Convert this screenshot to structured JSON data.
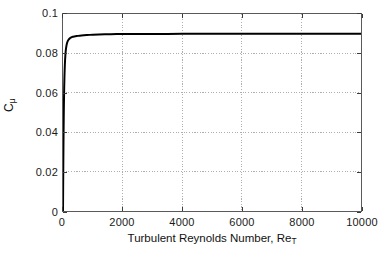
{
  "chart_data": {
    "type": "line",
    "title": "",
    "subtitle": "",
    "xlabel_prefix": "Turbulent Reynolds Number, Re",
    "xlabel_subscript": "T",
    "xlabel_full": "Turbulent Reynolds Number, Re_T",
    "ylabel_prefix": "C",
    "ylabel_subscript": "μ",
    "ylabel_full": "C_μ",
    "xlim": [
      0,
      10000
    ],
    "ylim": [
      0,
      0.1
    ],
    "xticks": [
      0,
      2000,
      4000,
      6000,
      8000,
      10000
    ],
    "xtick_labels": [
      "0",
      "2000",
      "4000",
      "6000",
      "8000",
      "10000"
    ],
    "yticks": [
      0,
      0.02,
      0.04,
      0.06,
      0.08,
      0.1
    ],
    "ytick_labels": [
      "0",
      "0.02",
      "0.04",
      "0.06",
      "0.08",
      "0.1"
    ],
    "grid": true,
    "grid_style": "dotted",
    "legend": null,
    "legend_position": "none",
    "line_color": "#000000",
    "line_width": 2.0,
    "asymptote_value": 0.09,
    "series": [
      {
        "name": "C_mu",
        "x": [
          0,
          5,
          10,
          15,
          20,
          25,
          30,
          40,
          50,
          60,
          70,
          80,
          90,
          100,
          120,
          140,
          160,
          180,
          200,
          230,
          260,
          300,
          340,
          380,
          420,
          460,
          500,
          560,
          620,
          700,
          800,
          900,
          1000,
          1200,
          1400,
          1600,
          1800,
          2000,
          2500,
          3000,
          3500,
          4000,
          5000,
          6000,
          7000,
          8000,
          9000,
          10000
        ],
        "y": [
          0.0,
          0.0118,
          0.0228,
          0.0325,
          0.0408,
          0.0478,
          0.0537,
          0.0627,
          0.069,
          0.0735,
          0.0768,
          0.0792,
          0.081,
          0.0824,
          0.0843,
          0.0855,
          0.0863,
          0.0868,
          0.0872,
          0.0877,
          0.088,
          0.0883,
          0.0885,
          0.0886,
          0.0887,
          0.0888,
          0.0889,
          0.089,
          0.0891,
          0.0892,
          0.0893,
          0.0894,
          0.0895,
          0.0896,
          0.0897,
          0.0897,
          0.0898,
          0.0898,
          0.0899,
          0.0899,
          0.0899,
          0.09,
          0.09,
          0.09,
          0.09,
          0.09,
          0.09,
          0.09
        ]
      }
    ]
  },
  "figure": {
    "background": "#ffffff",
    "axes_color": "#5a5a5a",
    "grid_color": "#9a9a9a",
    "text_color": "#111111"
  }
}
